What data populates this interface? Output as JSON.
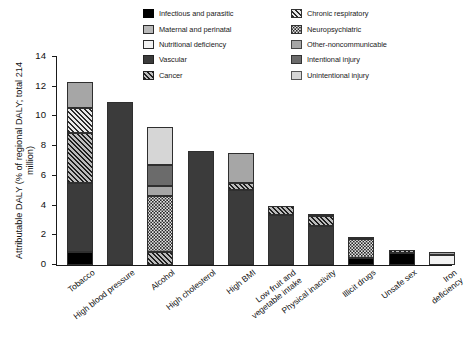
{
  "chart_data": {
    "type": "bar",
    "stacked": true,
    "title": "",
    "xlabel": "",
    "ylabel": "Attributable DALY (% of regional DALY; total 214 million)",
    "ylim": [
      0,
      14
    ],
    "yticks": [
      0,
      2,
      4,
      6,
      8,
      10,
      12,
      14
    ],
    "grid": false,
    "legend_position": "top-center",
    "categories": [
      "Tobacco",
      "High blood pressure",
      "Alcohol",
      "High cholesterol",
      "High BMI",
      "Low fruit and vegetable intake",
      "Physical inactivity",
      "Illicit drugs",
      "Unsafe sex",
      "Iron deficiency"
    ],
    "series": [
      {
        "name": "Infectious and parasitic",
        "key": "infectious",
        "pattern": "solid-black",
        "color": "#000000",
        "values": [
          0.9,
          0,
          0,
          0,
          0,
          0,
          0,
          0.45,
          0.8,
          0
        ]
      },
      {
        "name": "Maternal and perinatal",
        "key": "maternal",
        "pattern": "solid-midgray",
        "color": "#b9b9b9",
        "values": [
          0,
          0,
          0,
          0,
          0,
          0,
          0,
          0,
          0,
          0
        ]
      },
      {
        "name": "Nutritional deficiency",
        "key": "nutritional",
        "pattern": "solid-white",
        "color": "#f2f2f2",
        "values": [
          0,
          0,
          0,
          0,
          0,
          0,
          0,
          0,
          0,
          0.65
        ]
      },
      {
        "name": "Vascular",
        "key": "vascular",
        "pattern": "solid-darkgray",
        "color": "#3b3b3b",
        "values": [
          4.6,
          10.95,
          0,
          7.65,
          5.05,
          3.4,
          2.65,
          0,
          0,
          0
        ]
      },
      {
        "name": "Cancer",
        "key": "cancer",
        "pattern": "diagonal-hatch-dark",
        "color": "#1f1f1f",
        "values": [
          3.4,
          0,
          0.9,
          0,
          0.45,
          0.55,
          0.65,
          0,
          0.2,
          0
        ]
      },
      {
        "name": "Chronic respiratory",
        "key": "chronic",
        "pattern": "diagonal-hatch-light",
        "color": "#2a2a2a",
        "values": [
          1.7,
          0,
          0,
          0,
          0,
          0,
          0,
          0,
          0,
          0
        ]
      },
      {
        "name": "Neuropsychiatric",
        "key": "neuro",
        "pattern": "checker-dots",
        "color": "#e6e6e6",
        "values": [
          0,
          0,
          3.75,
          0,
          0,
          0,
          0,
          1.3,
          0,
          0
        ]
      },
      {
        "name": "Other-noncommunicable",
        "key": "othernc",
        "pattern": "solid-lightgray",
        "color": "#a6a6a6",
        "values": [
          1.7,
          0,
          0.65,
          0,
          2.05,
          0,
          0.12,
          0.15,
          0,
          0.25
        ]
      },
      {
        "name": "Intentional injury",
        "key": "intentional",
        "pattern": "solid-gray",
        "color": "#6b6b6b",
        "values": [
          0,
          0,
          1.45,
          0,
          0,
          0,
          0,
          0,
          0,
          0
        ]
      },
      {
        "name": "Unintentional injury",
        "key": "unintentional",
        "pattern": "solid-palegray",
        "color": "#d6d6d6",
        "values": [
          0,
          0,
          2.55,
          0,
          0,
          0,
          0,
          0,
          0,
          0
        ]
      }
    ],
    "totals": [
      12.3,
      10.95,
      9.3,
      7.65,
      7.55,
      3.95,
      3.42,
      1.9,
      1.0,
      0.9
    ]
  },
  "legend": {
    "left_column": [
      {
        "label": "Infectious and parasitic",
        "key": "infectious"
      },
      {
        "label": "Maternal and perinatal",
        "key": "maternal"
      },
      {
        "label": "Nutritional deficiency",
        "key": "nutritional"
      },
      {
        "label": "Vascular",
        "key": "vascular"
      },
      {
        "label": "Cancer",
        "key": "cancer"
      }
    ],
    "right_column": [
      {
        "label": "Chronic respiratory",
        "key": "chronic"
      },
      {
        "label": "Neuropsychiatric",
        "key": "neuro"
      },
      {
        "label": "Other-noncommunicable",
        "key": "othernc"
      },
      {
        "label": "Intentional injury",
        "key": "intentional"
      },
      {
        "label": "Unintentional injury",
        "key": "unintentional"
      }
    ]
  },
  "axes": {
    "y_title": "Attributable DALY (% of regional DALY;\ntotal 214 million)",
    "y_tick_labels": [
      "0",
      "2",
      "4",
      "6",
      "8",
      "10",
      "12",
      "14"
    ]
  }
}
